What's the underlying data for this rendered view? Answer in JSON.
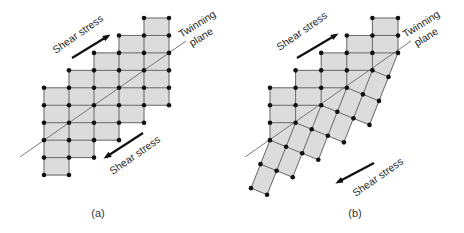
{
  "figure": {
    "panels": [
      {
        "id": "a",
        "caption": "(a)",
        "caption_x": 98,
        "state": "original lattice",
        "grid": {
          "x0": 44,
          "dx": 25,
          "y0": 18,
          "dy": 17.45,
          "col_row_ranges": [
            [
              4,
              9
            ],
            [
              3,
              9
            ],
            [
              2,
              8
            ],
            [
              1,
              7
            ],
            [
              0,
              6
            ],
            [
              0,
              5
            ]
          ]
        },
        "twin": null,
        "plane_line": [
          [
            20,
            157
          ],
          [
            186,
            41
          ]
        ],
        "labels": {
          "shear_top": {
            "text": "Shear stress",
            "x": 80,
            "y": 37,
            "angle": -35
          },
          "shear_bottom": {
            "text": "Shear stress",
            "x": 137,
            "y": 158,
            "angle": -35
          },
          "plane_line1": {
            "text": "Twinning",
            "x": 199,
            "y": 27,
            "angle": -32
          },
          "plane_line2": {
            "text": "plane",
            "x": 203,
            "y": 40,
            "angle": -32
          }
        },
        "arrows": {
          "top": [
            [
              72,
              58
            ],
            [
              108,
              36
            ]
          ],
          "bottom": [
            [
              143,
              133
            ],
            [
              106,
              157
            ]
          ]
        }
      },
      {
        "id": "b",
        "caption": "(b)",
        "caption_x": 355,
        "state": "twinned lattice",
        "grid": {
          "x0": 270,
          "dx": 25.6,
          "y0": 18,
          "dy": 17.45,
          "col_row_ranges": [
            [
              4,
              9
            ],
            [
              3,
              9
            ],
            [
              2,
              8
            ],
            [
              1,
              7
            ],
            [
              0,
              6
            ],
            [
              0,
              5
            ]
          ]
        },
        "plane_rows": [
          7,
          6,
          5,
          4,
          3,
          2
        ],
        "twin": {
          "b_vector": [
            -9.5,
            24
          ],
          "depth_per_column": [
            2,
            3,
            3,
            3,
            3,
            3
          ]
        },
        "plane_line": [
          [
            245,
            157
          ],
          [
            411,
            41
          ]
        ],
        "labels": {
          "shear_top": {
            "text": "Shear stress",
            "x": 304,
            "y": 34,
            "angle": -35
          },
          "shear_bottom": {
            "text": "Shear stress",
            "x": 380,
            "y": 180,
            "angle": -35
          },
          "plane_line1": {
            "text": "Twinning",
            "x": 423,
            "y": 27,
            "angle": -32
          },
          "plane_line2": {
            "text": "plane",
            "x": 428,
            "y": 40,
            "angle": -32
          }
        },
        "arrows": {
          "top": [
            [
              297,
              58
            ],
            [
              336,
              35
            ]
          ],
          "bottom": [
            [
              374,
              163
            ],
            [
              338,
              182
            ]
          ]
        }
      }
    ],
    "colors": {
      "cell_fill": "#dcdcdc",
      "lattice_line": "#5a5a5a",
      "atom": "#111111",
      "plane_line": "#6a6a6a",
      "arrow": "#111111"
    }
  }
}
